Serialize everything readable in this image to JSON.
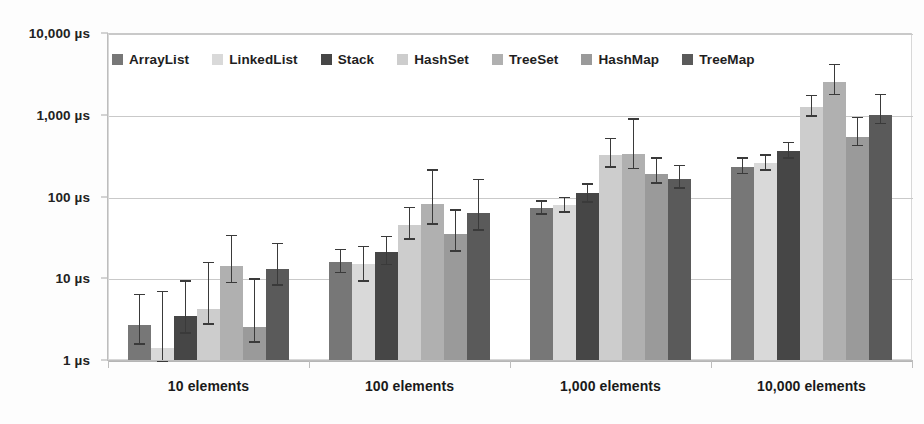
{
  "chart_data": {
    "type": "bar",
    "title": "",
    "subtitle": "",
    "xlabel": "",
    "ylabel": "",
    "yscale": "log",
    "ylim": [
      1,
      10000
    ],
    "grid": true,
    "legend_position": "top-inside",
    "y_ticks": [
      {
        "value": 1,
        "label": "1 µs"
      },
      {
        "value": 10,
        "label": "10 µs"
      },
      {
        "value": 100,
        "label": "100 µs"
      },
      {
        "value": 1000,
        "label": "1,000 µs"
      },
      {
        "value": 10000,
        "label": "10,000 µs"
      }
    ],
    "categories": [
      "10 elements",
      "100 elements",
      "1,000 elements",
      "10,000 elements"
    ],
    "series": [
      {
        "name": "ArrayList",
        "color": "#777777",
        "values": [
          2.7,
          16,
          72,
          230
        ],
        "error_low": [
          1.6,
          12,
          62,
          195
        ],
        "error_high": [
          6.5,
          23,
          90,
          300
        ]
      },
      {
        "name": "LinkedList",
        "color": "#d9d9d9",
        "values": [
          1.4,
          15,
          78,
          255
        ],
        "error_low": [
          1.0,
          9.5,
          66,
          215
        ],
        "error_high": [
          7.0,
          25,
          100,
          330
        ]
      },
      {
        "name": "Stack",
        "color": "#464646",
        "values": [
          3.5,
          21,
          110,
          360
        ],
        "error_low": [
          2.2,
          15,
          88,
          300
        ],
        "error_high": [
          9.5,
          33,
          145,
          470
        ]
      },
      {
        "name": "HashSet",
        "color": "#cdcdcd",
        "values": [
          4.2,
          45,
          320,
          1250
        ],
        "error_low": [
          2.8,
          31,
          235,
          990
        ],
        "error_high": [
          16,
          75,
          520,
          1750
        ]
      },
      {
        "name": "TreeSet",
        "color": "#b0b0b0",
        "values": [
          14,
          82,
          330,
          2500
        ],
        "error_low": [
          9.0,
          47,
          225,
          1800
        ],
        "error_high": [
          34,
          215,
          900,
          4200
        ]
      },
      {
        "name": "HashMap",
        "color": "#9a9a9a",
        "values": [
          2.5,
          35,
          190,
          540
        ],
        "error_low": [
          1.7,
          22,
          150,
          430
        ],
        "error_high": [
          10,
          70,
          300,
          940
        ]
      },
      {
        "name": "TreeMap",
        "color": "#5a5a5a",
        "values": [
          13,
          63,
          165,
          1000
        ],
        "error_low": [
          8.5,
          40,
          130,
          800
        ],
        "error_high": [
          27,
          165,
          245,
          1800
        ]
      }
    ]
  },
  "legend": {
    "items": [
      {
        "label": "ArrayList"
      },
      {
        "label": "LinkedList"
      },
      {
        "label": "Stack"
      },
      {
        "label": "HashSet"
      },
      {
        "label": "TreeSet"
      },
      {
        "label": "HashMap"
      },
      {
        "label": "TreeMap"
      }
    ]
  }
}
